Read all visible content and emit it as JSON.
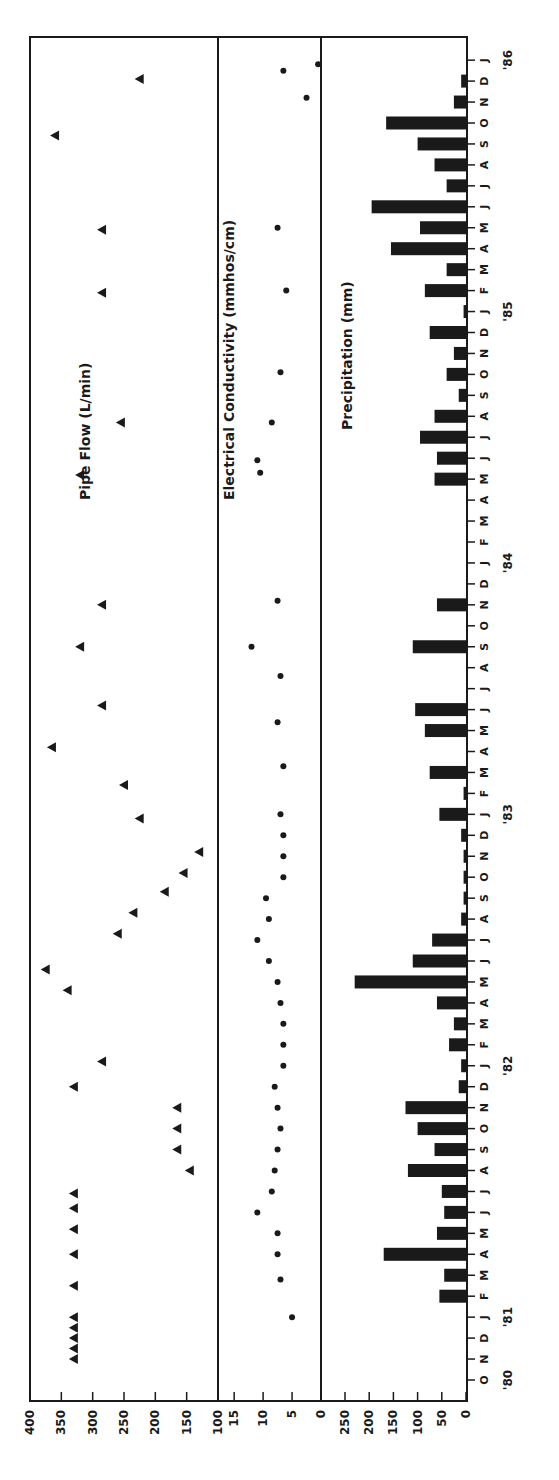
{
  "chart_data": [
    {
      "type": "scatter",
      "title": "Pipe Flow (L/min)",
      "marker": "triangle",
      "xlabel": "Month (Oct 1980 - Jan 1986)",
      "ylabel": "Pipe Flow (L/min)",
      "ylim": [
        100,
        400
      ],
      "yticks": [
        400,
        350,
        300,
        250,
        200,
        150,
        100
      ],
      "points": [
        {
          "m": 1.0,
          "v": 330
        },
        {
          "m": 1.5,
          "v": 330
        },
        {
          "m": 2.0,
          "v": 330
        },
        {
          "m": 2.5,
          "v": 330
        },
        {
          "m": 3.0,
          "v": 330
        },
        {
          "m": 4.5,
          "v": 330
        },
        {
          "m": 6.0,
          "v": 330
        },
        {
          "m": 7.2,
          "v": 330
        },
        {
          "m": 8.2,
          "v": 330
        },
        {
          "m": 8.9,
          "v": 330
        },
        {
          "m": 10.0,
          "v": 145
        },
        {
          "m": 11.0,
          "v": 165
        },
        {
          "m": 12.0,
          "v": 165
        },
        {
          "m": 13.0,
          "v": 165
        },
        {
          "m": 14.0,
          "v": 330
        },
        {
          "m": 15.2,
          "v": 285
        },
        {
          "m": 18.6,
          "v": 340
        },
        {
          "m": 19.6,
          "v": 375
        },
        {
          "m": 21.3,
          "v": 260
        },
        {
          "m": 22.3,
          "v": 235
        },
        {
          "m": 23.3,
          "v": 185
        },
        {
          "m": 24.2,
          "v": 155
        },
        {
          "m": 25.2,
          "v": 130
        },
        {
          "m": 26.8,
          "v": 225
        },
        {
          "m": 28.4,
          "v": 250
        },
        {
          "m": 30.2,
          "v": 365
        },
        {
          "m": 32.2,
          "v": 285
        },
        {
          "m": 35.0,
          "v": 320
        },
        {
          "m": 37.0,
          "v": 285
        },
        {
          "m": 43.2,
          "v": 320
        },
        {
          "m": 45.7,
          "v": 255
        },
        {
          "m": 51.9,
          "v": 285
        },
        {
          "m": 54.9,
          "v": 285
        },
        {
          "m": 59.4,
          "v": 360
        },
        {
          "m": 62.1,
          "v": 225
        }
      ]
    },
    {
      "type": "scatter",
      "title": "Electrical Conductivity (mmhos/cm)",
      "marker": "circle",
      "ylabel": "Electrical Conductivity (mmhos/cm)",
      "ylim": [
        0,
        17.5
      ],
      "yticks": [
        15,
        10,
        5,
        0
      ],
      "points": [
        {
          "m": 3.0,
          "v": 5.0
        },
        {
          "m": 4.8,
          "v": 7.0
        },
        {
          "m": 6.0,
          "v": 7.5
        },
        {
          "m": 7.0,
          "v": 7.5
        },
        {
          "m": 8.0,
          "v": 11.0
        },
        {
          "m": 9.0,
          "v": 8.5
        },
        {
          "m": 10.0,
          "v": 8.0
        },
        {
          "m": 11.0,
          "v": 7.5
        },
        {
          "m": 12.0,
          "v": 7.0
        },
        {
          "m": 13.0,
          "v": 7.5
        },
        {
          "m": 14.0,
          "v": 8.0
        },
        {
          "m": 15.0,
          "v": 6.5
        },
        {
          "m": 16.0,
          "v": 6.5
        },
        {
          "m": 17.0,
          "v": 6.5
        },
        {
          "m": 18.0,
          "v": 7.0
        },
        {
          "m": 19.0,
          "v": 7.5
        },
        {
          "m": 20.0,
          "v": 9.0
        },
        {
          "m": 21.0,
          "v": 11.0
        },
        {
          "m": 22.0,
          "v": 9.0
        },
        {
          "m": 23.0,
          "v": 9.5
        },
        {
          "m": 24.0,
          "v": 6.5
        },
        {
          "m": 25.0,
          "v": 6.5
        },
        {
          "m": 26.0,
          "v": 6.5
        },
        {
          "m": 27.0,
          "v": 7.0
        },
        {
          "m": 29.3,
          "v": 6.5
        },
        {
          "m": 31.4,
          "v": 7.5
        },
        {
          "m": 33.6,
          "v": 7.0
        },
        {
          "m": 35.0,
          "v": 12.0
        },
        {
          "m": 37.2,
          "v": 7.5
        },
        {
          "m": 43.3,
          "v": 10.5
        },
        {
          "m": 43.9,
          "v": 11.0
        },
        {
          "m": 45.7,
          "v": 8.5
        },
        {
          "m": 48.1,
          "v": 7.0
        },
        {
          "m": 52.0,
          "v": 6.0
        },
        {
          "m": 55.0,
          "v": 7.5
        },
        {
          "m": 61.2,
          "v": 2.5
        },
        {
          "m": 62.5,
          "v": 6.5
        },
        {
          "m": 62.8,
          "v": 0.5
        }
      ]
    },
    {
      "type": "bar",
      "title": "Precipitation (mm)",
      "ylabel": "Precipitation (mm)",
      "ylim": [
        0,
        260
      ],
      "yticks": [
        250,
        200,
        150,
        100,
        50,
        0
      ],
      "bars": [
        {
          "m": 4,
          "v": 55
        },
        {
          "m": 5,
          "v": 45
        },
        {
          "m": 6,
          "v": 170
        },
        {
          "m": 7,
          "v": 60
        },
        {
          "m": 8,
          "v": 45
        },
        {
          "m": 9,
          "v": 50
        },
        {
          "m": 10,
          "v": 120
        },
        {
          "m": 11,
          "v": 65
        },
        {
          "m": 12,
          "v": 100
        },
        {
          "m": 13,
          "v": 125
        },
        {
          "m": 14,
          "v": 15
        },
        {
          "m": 15,
          "v": 10
        },
        {
          "m": 16,
          "v": 35
        },
        {
          "m": 17,
          "v": 25
        },
        {
          "m": 18,
          "v": 60
        },
        {
          "m": 19,
          "v": 230
        },
        {
          "m": 20,
          "v": 110
        },
        {
          "m": 21,
          "v": 70
        },
        {
          "m": 22,
          "v": 10
        },
        {
          "m": 23,
          "v": 5
        },
        {
          "m": 24,
          "v": 5
        },
        {
          "m": 25,
          "v": 5
        },
        {
          "m": 26,
          "v": 10
        },
        {
          "m": 27,
          "v": 55
        },
        {
          "m": 28,
          "v": 5
        },
        {
          "m": 29,
          "v": 75
        },
        {
          "m": 31,
          "v": 85
        },
        {
          "m": 32,
          "v": 105
        },
        {
          "m": 35,
          "v": 110
        },
        {
          "m": 37,
          "v": 60
        },
        {
          "m": 43,
          "v": 65
        },
        {
          "m": 44,
          "v": 60
        },
        {
          "m": 45,
          "v": 95
        },
        {
          "m": 46,
          "v": 65
        },
        {
          "m": 47,
          "v": 15
        },
        {
          "m": 48,
          "v": 40
        },
        {
          "m": 49,
          "v": 25
        },
        {
          "m": 50,
          "v": 75
        },
        {
          "m": 51,
          "v": 5
        },
        {
          "m": 52,
          "v": 85
        },
        {
          "m": 53,
          "v": 40
        },
        {
          "m": 54,
          "v": 155
        },
        {
          "m": 55,
          "v": 95
        },
        {
          "m": 56,
          "v": 195
        },
        {
          "m": 57,
          "v": 40
        },
        {
          "m": 58,
          "v": 65
        },
        {
          "m": 59,
          "v": 100
        },
        {
          "m": 60,
          "v": 165
        },
        {
          "m": 61,
          "v": 25
        },
        {
          "m": 62,
          "v": 10
        }
      ]
    }
  ],
  "time_axis": {
    "months": [
      "O",
      "N",
      "D",
      "J",
      "F",
      "M",
      "A",
      "M",
      "J",
      "J",
      "A",
      "S",
      "O",
      "N",
      "D",
      "J",
      "F",
      "M",
      "A",
      "M",
      "J",
      "J",
      "A",
      "S",
      "O",
      "N",
      "D",
      "J",
      "F",
      "M",
      "A",
      "M",
      "J",
      "J",
      "A",
      "S",
      "O",
      "N",
      "D",
      "J",
      "F",
      "M",
      "A",
      "M",
      "J",
      "J",
      "A",
      "S",
      "O",
      "N",
      "D",
      "J",
      "F",
      "M",
      "A",
      "M",
      "J",
      "J",
      "A",
      "S",
      "O",
      "N",
      "D",
      "J"
    ],
    "years": [
      {
        "label": "'80",
        "m": 0
      },
      {
        "label": "'81",
        "m": 3
      },
      {
        "label": "'82",
        "m": 15
      },
      {
        "label": "'83",
        "m": 27
      },
      {
        "label": "'84",
        "m": 39
      },
      {
        "label": "'85",
        "m": 51
      },
      {
        "label": "'86",
        "m": 63
      }
    ]
  },
  "panels": {
    "pipe_flow": {
      "label": "Pipe Flow (L/min)",
      "ticks": [
        "400",
        "350",
        "300",
        "250",
        "200",
        "150",
        "100"
      ]
    },
    "conductivity": {
      "label": "Electrical Conductivity (mmhos/cm)",
      "ticks": [
        "15",
        "10",
        "5",
        "0"
      ]
    },
    "precipitation": {
      "label": "Precipitation (mm)",
      "ticks": [
        "250",
        "200",
        "150",
        "100",
        "50",
        "0"
      ]
    }
  },
  "colors": {
    "ink": "#1a1a1a",
    "background": "#ffffff"
  }
}
